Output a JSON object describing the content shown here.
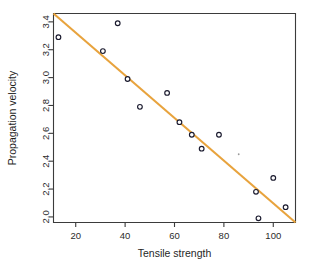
{
  "chart_data": {
    "type": "scatter",
    "title": "",
    "xlabel": "Tensile strength",
    "ylabel": "Propagation velocity",
    "xlim": [
      11,
      109
    ],
    "ylim": [
      1.96,
      3.46
    ],
    "xticks": [
      20,
      40,
      60,
      80,
      100
    ],
    "xtick_labels": [
      "20",
      "40",
      "60",
      "80",
      "100"
    ],
    "yticks": [
      2.0,
      2.2,
      2.4,
      2.6,
      2.8,
      3.0,
      3.2,
      3.4
    ],
    "ytick_labels": [
      "2.0",
      "2.2",
      "2.4",
      "2.6",
      "2.8",
      "3.0",
      "3.2",
      "3.4"
    ],
    "grid": false,
    "legend": "none",
    "series": [
      {
        "name": "observations",
        "marker": "open-circle",
        "marker_color": "#1a1a2e",
        "x": [
          13,
          31,
          37,
          41,
          46,
          57,
          62,
          67,
          71,
          78,
          93,
          94,
          100,
          105
        ],
        "y": [
          3.29,
          3.19,
          3.39,
          2.99,
          2.79,
          2.89,
          2.68,
          2.59,
          2.49,
          2.59,
          2.18,
          1.99,
          2.28,
          2.07
        ]
      }
    ],
    "fit_line": {
      "name": "regression line",
      "color": "#E8A33D",
      "x_start": 11,
      "y_start": 3.46,
      "x_end": 109,
      "y_end": 1.96
    },
    "stray_mark": {
      "x": 86,
      "y": 2.45
    }
  },
  "axis": {
    "x_title": "Tensile strength",
    "y_title": "Propagation velocity"
  }
}
